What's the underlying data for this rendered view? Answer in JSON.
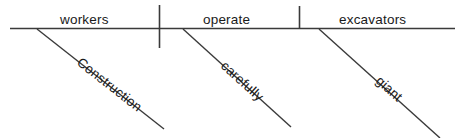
{
  "diagram": {
    "type": "reed-kellogg-sentence-diagram",
    "sentence": "Construction workers operate giant excavators carefully",
    "baseline": {
      "subject": "workers",
      "verb": "operate",
      "object": "excavators"
    },
    "modifiers": {
      "subject_modifier": "Construction",
      "verb_modifier": "carefully",
      "object_modifier": "giant"
    },
    "colors": {
      "line": "#3a3a3a",
      "text": "#1a1a1a",
      "background": "#ffffff"
    },
    "geometry": {
      "baseline_y": 28,
      "baseline_x_start": 10,
      "baseline_x_end": 455,
      "subject_verb_divider_x": 159,
      "verb_object_divider_x": 299
    }
  }
}
